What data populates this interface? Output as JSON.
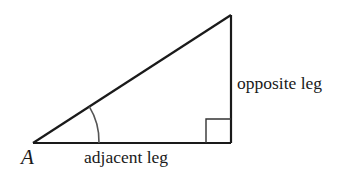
{
  "diagram": {
    "type": "right-triangle",
    "vertices": {
      "A": {
        "x": 33,
        "y": 143
      },
      "right_angle": {
        "x": 231,
        "y": 143
      },
      "top": {
        "x": 231,
        "y": 15
      }
    },
    "labels": {
      "vertex": "A",
      "adjacent": "adjacent leg",
      "opposite": "opposite leg"
    },
    "angle_marker": {
      "vertex": "A",
      "radius": 66
    },
    "right_angle_marker": {
      "size": 25
    },
    "colors": {
      "stroke": "#1a1a1a",
      "arc": "#555555",
      "background": "#ffffff"
    }
  }
}
